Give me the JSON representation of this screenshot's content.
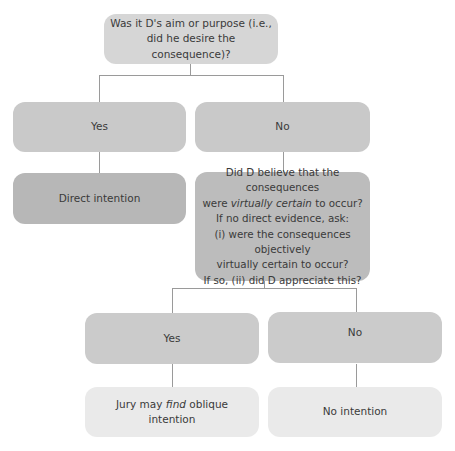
{
  "diagram": {
    "type": "flowchart",
    "root": {
      "line1": "Was it D's aim or purpose (i.e.,",
      "line2": "did he desire the consequence)?"
    },
    "level2": {
      "yes_label": "Yes",
      "no_label": "No"
    },
    "direct_intention": "Direct intention",
    "virtual_certainty_question": {
      "line1": "Did D believe that the consequences",
      "line2_pre": "were ",
      "line2_em": "virtually certain",
      "line2_post": " to occur?",
      "line3": "If no direct evidence, ask:",
      "line4": "(i) were the consequences objectively",
      "line5": "virtually certain to occur?",
      "line6": "If so, (ii) did D appreciate this?"
    },
    "level4": {
      "yes_label": "Yes",
      "no_label": "No"
    },
    "outcomes": {
      "oblique_pre": "Jury may ",
      "oblique_em": "find",
      "oblique_post": " oblique intention",
      "no_intention": "No intention"
    },
    "colors": {
      "root": "#d6d6d6",
      "level2": "#c9c9c9",
      "direct": "#b7b7b7",
      "question": "#bcbcbc",
      "level4": "#cbcbcb",
      "outcome": "#eaeaea",
      "connector": "#9a9a9a"
    }
  }
}
